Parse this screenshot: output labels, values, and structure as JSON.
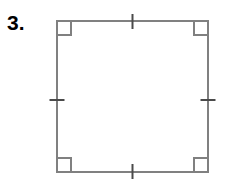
{
  "canvas": {
    "width": 228,
    "height": 191,
    "background_color": "#ffffff"
  },
  "problem": {
    "number_label": "3."
  },
  "figure": {
    "shape_name": "square",
    "outline_color": "#808080",
    "outline_width": 2,
    "fill_color": "none",
    "bounds": {
      "left": 57,
      "top": 21,
      "right": 208,
      "bottom": 172,
      "side_length_px": 151
    },
    "right_angle_marks": {
      "count": 4,
      "size_px": 14,
      "color": "#808080",
      "stroke_width": 2,
      "positions": [
        "top-left",
        "top-right",
        "bottom-left",
        "bottom-right"
      ]
    },
    "congruence_tick_marks": {
      "count": 4,
      "ticks_per_side": 1,
      "length_px": 15,
      "color": "#4a4a4a",
      "stroke_width": 2,
      "positions": [
        "top-midpoint",
        "right-midpoint",
        "bottom-midpoint",
        "left-midpoint"
      ]
    }
  }
}
